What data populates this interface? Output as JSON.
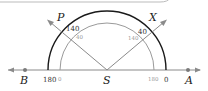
{
  "diagram": {
    "colors": {
      "outer_arc": "#1a1a1a",
      "inner_arc": "#9a9a9a",
      "rays": "#8a8a8a",
      "baseline": "#8a8a8a",
      "points": "#7a7a7a"
    },
    "points": {
      "P": "P",
      "X": "X",
      "S": "S",
      "A": "A",
      "B": "B"
    },
    "outer_scale": {
      "left_end": "180",
      "right_end": "0",
      "P_reading": "140",
      "X_reading": "40"
    },
    "inner_scale": {
      "left_end": "0",
      "right_end": "180",
      "P_reading": "40",
      "X_reading": "140"
    }
  }
}
